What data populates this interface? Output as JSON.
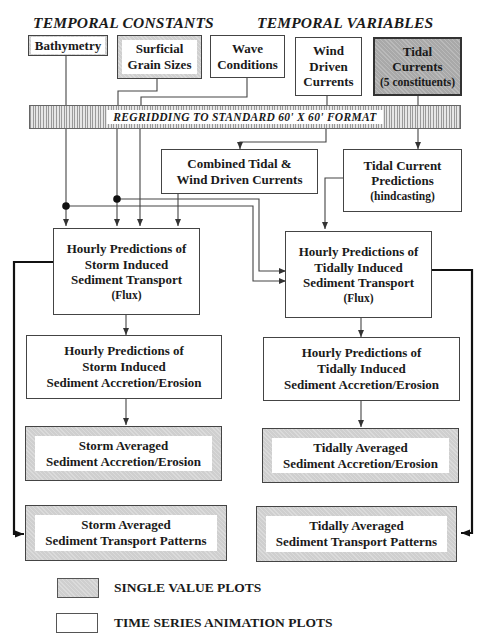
{
  "headers": {
    "constants": "TEMPORAL CONSTANTS",
    "variables": "TEMPORAL VARIABLES"
  },
  "inputs": [
    {
      "id": "bathymetry",
      "lines": [
        "Bathymetry"
      ],
      "style": "single-value"
    },
    {
      "id": "grain-sizes",
      "lines": [
        "Surficial",
        "Grain Sizes"
      ],
      "style": "single-value"
    },
    {
      "id": "wave-conditions",
      "lines": [
        "Wave",
        "Conditions"
      ],
      "style": "time-series"
    },
    {
      "id": "wind-currents",
      "lines": [
        "Wind",
        "Driven",
        "Currents"
      ],
      "style": "time-series"
    },
    {
      "id": "tidal-currents",
      "lines": [
        "Tidal",
        "Currents",
        "(5 constituents)"
      ],
      "style": "single-value-dark"
    }
  ],
  "regrid": {
    "label": "REGRIDDING TO STANDARD 60' X 60' FORMAT"
  },
  "intermediate": {
    "combined": {
      "lines": [
        "Combined Tidal &",
        "Wind Driven Currents"
      ]
    },
    "tidal_predictions": {
      "lines": [
        "Tidal Current",
        "Predictions",
        "(hindcasting)"
      ]
    }
  },
  "storm_column": {
    "transport": {
      "lines": [
        "Hourly Predictions of",
        "Storm Induced",
        "Sediment Transport",
        "(Flux)"
      ]
    },
    "accretion": {
      "lines": [
        "Hourly Predictions of",
        "Storm Induced",
        "Sediment Accretion/Erosion"
      ]
    },
    "averaged_accretion": {
      "lines": [
        "Storm Averaged",
        "Sediment Accretion/Erosion"
      ]
    },
    "averaged_transport": {
      "lines": [
        "Storm Averaged",
        "Sediment Transport Patterns"
      ]
    }
  },
  "tidal_column": {
    "transport": {
      "lines": [
        "Hourly Predictions of",
        "Tidally Induced",
        "Sediment Transport",
        "(Flux)"
      ]
    },
    "accretion": {
      "lines": [
        "Hourly Predictions of",
        "Tidally Induced",
        "Sediment Accretion/Erosion"
      ]
    },
    "averaged_accretion": {
      "lines": [
        "Tidally Averaged",
        "Sediment Accretion/Erosion"
      ]
    },
    "averaged_transport": {
      "lines": [
        "Tidally Averaged",
        "Sediment Transport Patterns"
      ]
    }
  },
  "legend": {
    "single_value": "SINGLE VALUE PLOTS",
    "time_series": "TIME SERIES ANIMATION PLOTS"
  },
  "colors": {
    "single_value_fill": "#cfcfcf",
    "tidal_fill": "#a9a9a9",
    "line": "#444444",
    "thick_line": "#1a1a1a"
  }
}
